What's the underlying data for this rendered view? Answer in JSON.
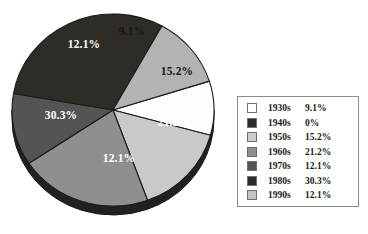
{
  "chart_data": {
    "type": "pie",
    "title": "",
    "subtitle": "",
    "xlabel": "",
    "ylabel": "",
    "grid": false,
    "legend_position": "right",
    "categories": [
      "1930s",
      "1940s",
      "1950s",
      "1960s",
      "1970s",
      "1980s",
      "1990s"
    ],
    "values": [
      9.1,
      0,
      15.2,
      21.2,
      12.1,
      30.3,
      12.1
    ],
    "value_labels": [
      "9.1%",
      "0%",
      "15.2%",
      "21.2%",
      "12.1%",
      "30.3%",
      "12.1%"
    ],
    "colors": [
      "#fdfdfd",
      "#2b2b2b",
      "#c9c9c9",
      "#8f8f8f",
      "#545454",
      "#2f2c28",
      "#b3b3b3"
    ],
    "slices": [
      {
        "name": "1930s",
        "value": 9.1,
        "label": "9.1%",
        "color": "#fdfdfd",
        "label_color": "dark",
        "start_angle": -17.5,
        "end_angle": 15.3,
        "label_x": 124,
        "label_y": 33
      },
      {
        "name": "1950s",
        "value": 15.2,
        "label": "15.2%",
        "color": "#c9c9c9",
        "label_color": "dark",
        "start_angle": 15.3,
        "end_angle": 70.0,
        "label_x": 169,
        "label_y": 73
      },
      {
        "name": "1960s",
        "value": 21.2,
        "label": "21.2%",
        "color": "#8f8f8f",
        "label_color": "light",
        "start_angle": 70.0,
        "end_angle": 146.3,
        "label_x": 166,
        "label_y": 124
      },
      {
        "name": "1970s",
        "value": 12.1,
        "label": "12.1%",
        "color": "#545454",
        "label_color": "light",
        "start_angle": 146.3,
        "end_angle": 189.9,
        "label_x": 111,
        "label_y": 160
      },
      {
        "name": "1980s",
        "value": 30.3,
        "label": "30.3%",
        "color": "#2f2c28",
        "label_color": "light",
        "start_angle": 189.9,
        "end_angle": 299.0,
        "label_x": 53,
        "label_y": 117
      },
      {
        "name": "1990s",
        "value": 12.1,
        "label": "12.1%",
        "color": "#b3b3b3",
        "label_color": "light",
        "start_angle": 299.0,
        "end_angle": 342.5,
        "label_x": 76,
        "label_y": 46
      }
    ]
  },
  "legend": {
    "rows": [
      {
        "key": "1930s",
        "value": "9.1%",
        "swatch": "#fdfdfd"
      },
      {
        "key": "1940s",
        "value": "0%",
        "swatch": "#2b2b2b"
      },
      {
        "key": "1950s",
        "value": "15.2%",
        "swatch": "#cccccc"
      },
      {
        "key": "1960s",
        "value": "21.2%",
        "swatch": "#8f8f8f"
      },
      {
        "key": "1970s",
        "value": "12.1%",
        "swatch": "#545454"
      },
      {
        "key": "1980s",
        "value": "30.3%",
        "swatch": "#2b2b2b"
      },
      {
        "key": "1990s",
        "value": "12.1%",
        "swatch": "#c4c4c4"
      }
    ]
  },
  "style": {
    "slice_outline": "#1b1b1b",
    "legend_border": "#8d8d8d",
    "background": "#ffffff",
    "rim_shade": "#23211e"
  }
}
